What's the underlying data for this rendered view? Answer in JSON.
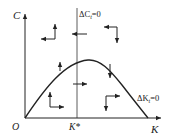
{
  "diagram": {
    "type": "phase-diagram",
    "axes": {
      "y_label": "C",
      "x_label": "K",
      "origin_label": "O"
    },
    "markers": {
      "k_star": "K*"
    },
    "loci": {
      "delta_c": {
        "label_prefix": "ΔC",
        "subscript": "t",
        "label_suffix": "=0"
      },
      "delta_k": {
        "label_prefix": "ΔK",
        "subscript": "t",
        "label_suffix": "=0"
      }
    },
    "colors": {
      "line": "#222222",
      "background": "#ffffff"
    },
    "direction_arrows": [
      {
        "region": "upper-left",
        "horizontal": "left",
        "vertical": "up"
      },
      {
        "region": "upper-right",
        "horizontal": "left",
        "vertical": "down"
      },
      {
        "region": "lower-left",
        "horizontal": "right",
        "vertical": "up"
      },
      {
        "region": "lower-right",
        "horizontal": "right",
        "vertical": "down"
      }
    ]
  }
}
